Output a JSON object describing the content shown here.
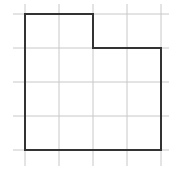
{
  "diagram": {
    "type": "grid-shape",
    "grid": {
      "columns": 4,
      "rows": 4,
      "cell_size": 34,
      "origin_x": 25,
      "origin_y": 14,
      "line_color": "#cccccc"
    },
    "shape": {
      "description": "L-shaped rectilinear polygon on a 4x4 grid, top-right 2x1 block removed",
      "vertices_grid": [
        [
          0,
          0
        ],
        [
          2,
          0
        ],
        [
          2,
          1
        ],
        [
          4,
          1
        ],
        [
          4,
          4
        ],
        [
          0,
          4
        ]
      ],
      "stroke_color": "#333333",
      "area_units": 14
    }
  }
}
